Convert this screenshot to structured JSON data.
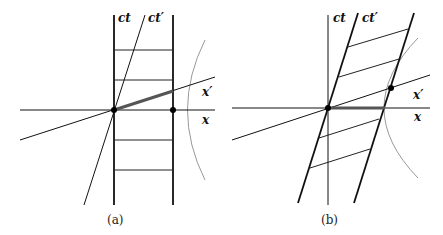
{
  "panels": [
    {
      "caption": "(a)",
      "labels": {
        "ct": "ct",
        "ct_prime": "ct′",
        "x": "x",
        "x_prime": "x′"
      }
    },
    {
      "caption": "(b)",
      "labels": {
        "ct": "ct",
        "ct_prime": "ct′",
        "x": "x",
        "x_prime": "x′"
      }
    }
  ],
  "colors": {
    "ink": "#111111",
    "hyperbola": "#999999",
    "highlight": "#555555"
  }
}
